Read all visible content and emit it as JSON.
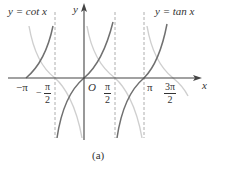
{
  "figure": {
    "caption": "(a)",
    "labels": {
      "cot_label": "y = cot x",
      "tan_label": "y = tan x",
      "y_axis": "y",
      "x_axis": "x",
      "origin": "O"
    },
    "ticks": [
      {
        "label": "−π",
        "type": "plain"
      },
      {
        "label_num": "π",
        "label_den": "2",
        "sign": "−",
        "type": "frac"
      },
      {
        "label_num": "π",
        "label_den": "2",
        "sign": "",
        "type": "frac"
      },
      {
        "label": "π",
        "type": "plain"
      },
      {
        "label_num": "3π",
        "label_den": "2",
        "sign": "",
        "type": "frac"
      }
    ],
    "colors": {
      "tan_curve": "#6e6e6e",
      "cot_curve": "#c8c8c8",
      "axes": "#444444",
      "asymptote": "#999999"
    }
  }
}
